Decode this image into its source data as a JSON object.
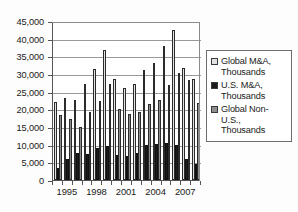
{
  "chart_data": {
    "type": "bar",
    "title": "",
    "xlabel": "",
    "ylabel": "",
    "ylim": [
      0,
      45000
    ],
    "ytick_step": 5000,
    "grid": true,
    "legend_position": "right",
    "categories": [
      "1994",
      "1995",
      "1996",
      "1997",
      "1998",
      "1999",
      "2000",
      "2001",
      "2002",
      "2003",
      "2004",
      "2005",
      "2006",
      "2007",
      "2008"
    ],
    "visible_tick_labels": [
      "1995",
      "1998",
      "2001",
      "2004",
      "2007"
    ],
    "ytick_labels": [
      "0",
      "5,000",
      "10,000",
      "15,000",
      "20,000",
      "25,000",
      "30,000",
      "35,000",
      "40,000",
      "45,000"
    ],
    "ytick_values": [
      0,
      5000,
      10000,
      15000,
      20000,
      25000,
      30000,
      35000,
      40000,
      45000
    ],
    "series": [
      {
        "name": "Global M&A, Thousands",
        "key": "global",
        "color": "#e2e2e2",
        "values": [
          22000,
          23100,
          22600,
          27100,
          31500,
          36700,
          28600,
          26000,
          27300,
          31100,
          33200,
          38000,
          42400,
          31800,
          28500
        ]
      },
      {
        "name": "U.S. M&A, Thousands",
        "key": "us",
        "color": "#1c1c1c",
        "values": [
          3500,
          5900,
          7600,
          7500,
          9000,
          9500,
          7100,
          6900,
          7700,
          9900,
          10200,
          10400,
          10000,
          6000,
          4500
        ]
      },
      {
        "name": "Global Non-U.S., Thousands",
        "key": "nonus",
        "color": "#8d8d8d",
        "values": [
          18500,
          17200,
          14900,
          19300,
          22300,
          27100,
          20100,
          18700,
          19200,
          21400,
          22600,
          27000,
          30400,
          28400,
          21900
        ]
      }
    ]
  },
  "legend": {
    "items": [
      {
        "label": "Global M&A,\nThousands",
        "swatch": "sw-global",
        "icon": "legend-swatch-global"
      },
      {
        "label": "U.S. M&A,\nThousands",
        "swatch": "sw-us",
        "icon": "legend-swatch-us"
      },
      {
        "label": "Global Non-\nU.S.,\nThousands",
        "swatch": "sw-nonus",
        "icon": "legend-swatch-nonus"
      }
    ]
  },
  "colors": {
    "global": "#e2e2e2",
    "us": "#1c1c1c",
    "nonus": "#8d8d8d",
    "axis": "#555555",
    "grid": "#9a9a9a",
    "text": "#1a1a1a",
    "background": "#ffffff"
  }
}
